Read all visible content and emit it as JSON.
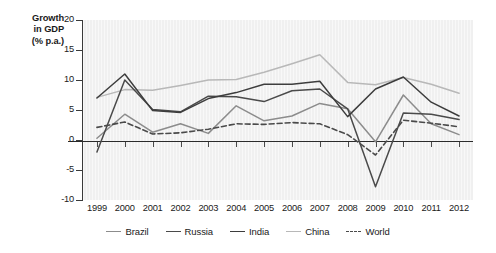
{
  "axis_title": {
    "line1": "Growth",
    "line2": "in GDP",
    "line3": "(% p.a.)"
  },
  "chart_data": {
    "type": "line",
    "title": "",
    "xlabel": "",
    "ylabel": "Growth in GDP (% p.a.)",
    "x": [
      1999,
      2000,
      2001,
      2002,
      2003,
      2004,
      2005,
      2006,
      2007,
      2008,
      2009,
      2010,
      2011,
      2012
    ],
    "xticklabels": [
      "1999",
      "2000",
      "2001",
      "2002",
      "2003",
      "2004",
      "2005",
      "2006",
      "2007",
      "2008",
      "2009",
      "2010",
      "2011",
      "2012"
    ],
    "ylim": [
      -10,
      20
    ],
    "yticks": [
      20,
      15,
      10,
      5,
      0,
      -5,
      -10
    ],
    "yticklabels": [
      "20",
      "15",
      "10",
      "5",
      "0",
      "-5",
      "-10"
    ],
    "grid": false,
    "legend_position": "bottom",
    "series": [
      {
        "name": "Brazil",
        "color": "#8c8c8c",
        "style": "solid",
        "values": [
          0.3,
          4.3,
          1.3,
          2.7,
          1.1,
          5.7,
          3.2,
          4.0,
          6.1,
          5.2,
          -0.3,
          7.5,
          2.7,
          0.9
        ]
      },
      {
        "name": "Russia",
        "color": "#4a4a4a",
        "style": "solid",
        "values": [
          -2.0,
          10.0,
          5.1,
          4.7,
          7.3,
          7.2,
          6.4,
          8.2,
          8.5,
          5.2,
          -7.8,
          4.5,
          4.3,
          3.4
        ]
      },
      {
        "name": "India",
        "color": "#3d3d3d",
        "style": "solid",
        "values": [
          7.0,
          11.0,
          4.9,
          4.6,
          6.9,
          7.9,
          9.3,
          9.3,
          9.8,
          3.9,
          8.5,
          10.5,
          6.3,
          4.0
        ]
      },
      {
        "name": "China",
        "color": "#b8b8b8",
        "style": "solid",
        "values": [
          7.1,
          8.4,
          8.3,
          9.1,
          10.0,
          10.1,
          11.3,
          12.7,
          14.2,
          9.6,
          9.2,
          10.4,
          9.3,
          7.8
        ]
      },
      {
        "name": "World",
        "color": "#4a4a4a",
        "style": "dashed",
        "values": [
          2.1,
          3.0,
          1.0,
          1.2,
          1.8,
          2.7,
          2.6,
          2.9,
          2.7,
          0.9,
          -2.5,
          3.3,
          2.8,
          2.2
        ]
      }
    ]
  },
  "legend": [
    {
      "label": "Brazil",
      "color": "#8c8c8c",
      "style": "solid"
    },
    {
      "label": "Russia",
      "color": "#4a4a4a",
      "style": "solid"
    },
    {
      "label": "India",
      "color": "#3d3d3d",
      "style": "solid"
    },
    {
      "label": "China",
      "color": "#b8b8b8",
      "style": "solid"
    },
    {
      "label": "World",
      "color": "#4a4a4a",
      "style": "dashed"
    }
  ]
}
